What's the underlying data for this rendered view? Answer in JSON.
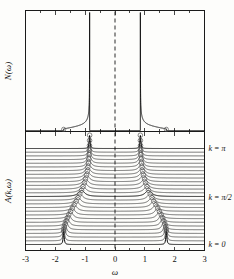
{
  "figure": {
    "title": "",
    "xlabel": "ω",
    "ylabel_top": "N(ω)",
    "ylabel_bottom": "A(k,ω)"
  },
  "axis": {
    "x_ticks": [
      "-3",
      "-2",
      "-1",
      "0",
      "1",
      "2",
      "3"
    ],
    "x_tick_values": [
      -3,
      -2,
      -1,
      0,
      1,
      2,
      3
    ],
    "xmin": -3,
    "xmax": 3
  },
  "k_labels": [
    {
      "text": "k = π",
      "key": "k-pi"
    },
    {
      "text": "k = π/2",
      "key": "k-pi-half"
    },
    {
      "text": "k = 0",
      "key": "k-zero"
    }
  ],
  "colors": {
    "line": "#111111",
    "marker_stroke": "#555555",
    "background": "#fdfdfb",
    "dash": "#2a2a2a"
  },
  "chart_data": {
    "type": "line",
    "title": "",
    "xlabel": "ω",
    "ylabel": "N(ω) and A(k,ω)",
    "xlim": [
      -3,
      3
    ],
    "grid": false,
    "legend": "none",
    "panels": [
      {
        "name": "density-of-states",
        "ylabel": "N(ω)",
        "description": "Density of states with two sharp van Hove divergences symmetric about ω = 0, separated by a gap; dashed vertical reference line at ω = 0.",
        "peak_positions": [
          -0.85,
          0.85
        ],
        "band_edges": [
          -1.72,
          -0.85,
          0.85,
          1.72
        ],
        "gap_center": 0.0,
        "dashed_line_x": 0.0
      },
      {
        "name": "spectral-function-stack",
        "ylabel": "A(k,ω)",
        "description": "Waterfall stack of spectral functions A(k,ω) offset vertically for 27 momenta from k = 0 (bottom) to k = π (top). Each curve has two Lorentzian-like peaks symmetric about ω = 0; open circle markers mark the peak positions, tracing the dispersion which moves inward from ω = ±1.72 at k = 0 to ω = ±0.85 at k = π.",
        "n_curves": 27,
        "k_min": 0,
        "k_max": 3.14159,
        "k_marked": [
          0,
          1.5708,
          3.14159
        ],
        "dashed_line_x": 0.0,
        "dispersion": {
          "k_over_pi": [
            0.0,
            0.0385,
            0.0769,
            0.1154,
            0.1538,
            0.1923,
            0.2308,
            0.2692,
            0.3077,
            0.3462,
            0.3846,
            0.4231,
            0.4615,
            0.5,
            0.5385,
            0.5769,
            0.6154,
            0.6538,
            0.6923,
            0.7308,
            0.7692,
            0.8077,
            0.8462,
            0.8846,
            0.9231,
            0.9615,
            1.0
          ],
          "peak_omega_positive": [
            1.72,
            1.715,
            1.7,
            1.675,
            1.64,
            1.6,
            1.55,
            1.49,
            1.43,
            1.37,
            1.3,
            1.24,
            1.18,
            1.12,
            1.07,
            1.025,
            0.99,
            0.955,
            0.93,
            0.91,
            0.893,
            0.879,
            0.869,
            0.861,
            0.856,
            0.852,
            0.85
          ],
          "peak_omega_negative": [
            -1.72,
            -1.715,
            -1.7,
            -1.675,
            -1.64,
            -1.6,
            -1.55,
            -1.49,
            -1.43,
            -1.37,
            -1.3,
            -1.24,
            -1.18,
            -1.12,
            -1.07,
            -1.025,
            -0.99,
            -0.955,
            -0.93,
            -0.91,
            -0.893,
            -0.879,
            -0.869,
            -0.861,
            -0.856,
            -0.852,
            -0.85
          ]
        }
      }
    ]
  }
}
